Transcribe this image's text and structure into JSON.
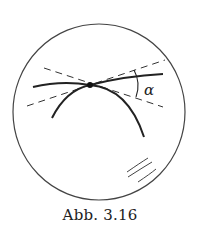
{
  "figure": {
    "caption": "Abb. 3.16",
    "angle_label": "α",
    "colors": {
      "stroke": "#222222",
      "circle": "#444444",
      "background": "#ffffff"
    },
    "elements": [
      "sphere-outline",
      "great-circle-curve-1",
      "great-circle-curve-2",
      "tangent-line-1-dashed",
      "tangent-line-2-dashed",
      "intersection-point",
      "angle-arc",
      "reflection-highlight"
    ]
  }
}
